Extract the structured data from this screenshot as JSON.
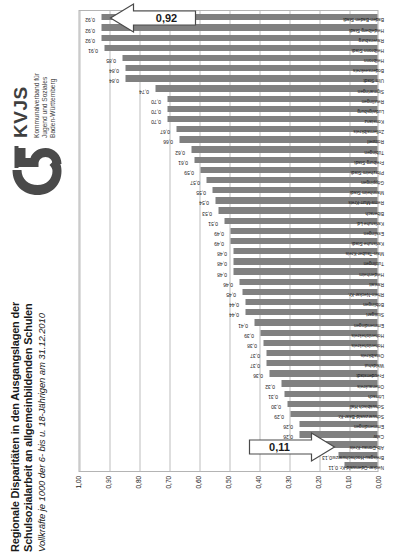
{
  "header": {
    "title_line1": "Regionale Disparitäten in den Ausgangslagen der",
    "title_line2": "Schulsozialarbeit an allgemeinbildenden Schulen",
    "subtitle": "Vollkräfte je 1000 der 6- bis u. 18-Jährigen am 31.12.2010"
  },
  "logo": {
    "name": "KVJS",
    "mark_icon": "kvjs-swoosh-logo",
    "sub_line1": "Kommunalverband für",
    "sub_line2": "Jugend und Soziales",
    "sub_line3": "Baden-Württemberg",
    "color": "#4a4a4a"
  },
  "callouts": [
    {
      "label": "0,11",
      "icon": "down-arrow-callout"
    },
    {
      "label": "0,92",
      "icon": "up-arrow-callout"
    }
  ],
  "chart_data": {
    "type": "bar",
    "title": "Regionale Disparitäten in den Ausgangslagen der Schulsozialarbeit an allgemeinbildenden Schulen",
    "subtitle": "Vollkräfte je 1000 der 6- bis u. 18-Jährigen am 31.12.2010",
    "xlabel": "",
    "ylabel": "",
    "ylim": [
      0.0,
      1.0
    ],
    "yticks": [
      "0,00",
      "0,10",
      "0,20",
      "0,30",
      "0,40",
      "0,50",
      "0,60",
      "0,70",
      "0,80",
      "0,90",
      "1,00"
    ],
    "ytick_values": [
      0.0,
      0.1,
      0.2,
      0.3,
      0.4,
      0.5,
      0.6,
      0.7,
      0.8,
      0.9,
      1.0
    ],
    "grid": true,
    "legend": false,
    "bar_color": "#808080",
    "categories": [
      "Neckar-Odenwald-Kr.",
      "Breisgau-Hochschwarzw.",
      "Alb-Donau-Kreis",
      "Calw",
      "Emmendingen",
      "Schwarzwald-Baar-Kr.",
      "Schwäbisch Hall",
      "Lörrach",
      "Ortenaukreis",
      "Freudenstadt",
      "Waldshut",
      "Ostalbkreis",
      "Hohenlohekreis",
      "Hohenlohekreis",
      "Emmendingen",
      "Stuttgart",
      "Böblingen",
      "Rhein-Neckar-Kr.",
      "Rastatt",
      "Heidenheim",
      "Tuttlingen",
      "Main-Tauber-Kreis",
      "Karlsruhe Stadt",
      "Esslingen",
      "Karlsruhe Ld.",
      "Biberach",
      "Rems-Murr-Kreis",
      "Mannheim Stadt",
      "Göppingen",
      "Pforzheim Stadt",
      "Freiburg Stadt",
      "Tübingen",
      "Rottweil",
      "Zollernalbkreis",
      "Konstanz",
      "Ludwigsburg",
      "Reutlingen",
      "Sigmaringen",
      "Ulm Stadt",
      "Bodenseekreis",
      "Heilbronn",
      "Heilbronn Stadt",
      "Ravensburg",
      "Heidelberg Stadt",
      "Baden-Baden Stadt"
    ],
    "values": [
      0.11,
      0.13,
      0.18,
      0.26,
      0.26,
      0.29,
      0.3,
      0.31,
      0.32,
      0.36,
      0.37,
      0.37,
      0.38,
      0.39,
      0.41,
      0.44,
      0.44,
      0.45,
      0.46,
      0.48,
      0.48,
      0.48,
      0.49,
      0.49,
      0.51,
      0.53,
      0.54,
      0.55,
      0.57,
      0.59,
      0.61,
      0.62,
      0.66,
      0.67,
      0.7,
      0.7,
      0.7,
      0.74,
      0.84,
      0.84,
      0.85,
      0.91,
      0.92,
      0.92,
      0.92
    ],
    "value_labels": [
      "0,11",
      "0,13",
      "0,18",
      "0,26",
      "0,26",
      "0,29",
      "0,30",
      "0,31",
      "0,32",
      "0,36",
      "0,37",
      "0,37",
      "0,38",
      "0,39",
      "0,41",
      "0,44",
      "0,44",
      "0,45",
      "0,46",
      "0,48",
      "0,48",
      "0,48",
      "0,49",
      "0,49",
      "0,51",
      "0,53",
      "0,54",
      "0,55",
      "0,57",
      "0,59",
      "0,61",
      "0,62",
      "0,66",
      "0,67",
      "0,70",
      "0,70",
      "0,70",
      "0,74",
      "0,84",
      "0,84",
      "0,85",
      "0,91",
      "0,92",
      "0,92",
      "0,92"
    ],
    "min_value": 0.11,
    "max_value": 0.92
  }
}
